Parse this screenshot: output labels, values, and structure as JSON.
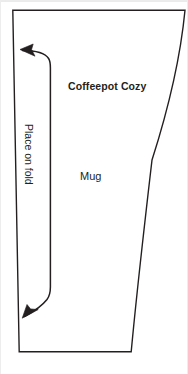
{
  "document": {
    "type": "sewing-pattern-template",
    "background_color": "#ffffff",
    "line_color": "#231f20",
    "width": 188,
    "height": 374
  },
  "labels": {
    "title": "Coffeepot Cozy",
    "part": "Mug",
    "fold": "Place on fold"
  },
  "pattern": {
    "outline_name": "cozy-pattern-outline",
    "fold_marker_name": "place-on-fold-arrow",
    "stroke_width": 1.4,
    "fill": "none"
  },
  "icons": {
    "arrow_up": "arrow-up-icon",
    "arrow_down": "arrow-down-icon"
  }
}
